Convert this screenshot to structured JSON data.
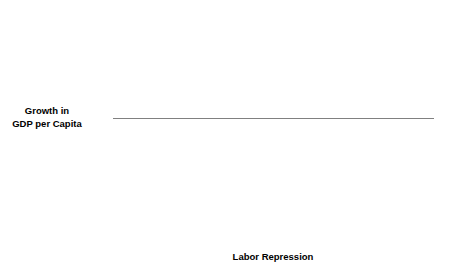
{
  "chart_data": {
    "type": "scatter",
    "title": "",
    "xlabel": "Labor Repression",
    "ylabel_line1": "Growth in",
    "ylabel_line2": "GDP per Capita",
    "xlim": [
      0.0,
      5.0
    ],
    "ylim": [
      -4,
      10
    ],
    "xticks": [
      "0.0",
      "0.5",
      "1.0",
      "1.5",
      "2.0",
      "2.5",
      "3.0",
      "3.5",
      "4.0",
      "4.5",
      "5.0"
    ],
    "xtick_values": [
      0.0,
      0.5,
      1.0,
      1.5,
      2.0,
      2.5,
      3.0,
      3.5,
      4.0,
      4.5,
      5.0
    ],
    "yticks": [
      "10",
      "8",
      "6",
      "4",
      "2",
      "0",
      "−2",
      "−4"
    ],
    "ytick_values": [
      10,
      8,
      6,
      4,
      2,
      0,
      -2,
      -4
    ],
    "grid": false,
    "legend": null,
    "reference_line": {
      "orientation": "horizontal",
      "y": 3.0,
      "color": "#808080"
    },
    "marker_color": "#111111",
    "marker_size": 2.3,
    "points": [
      {
        "x": 0.25,
        "y": -0.62
      },
      {
        "x": 0.29,
        "y": 4.27
      },
      {
        "x": 0.3,
        "y": 3.58
      },
      {
        "x": 0.43,
        "y": 4.35
      },
      {
        "x": 0.44,
        "y": 3.8
      },
      {
        "x": 0.57,
        "y": 2.93
      },
      {
        "x": 0.68,
        "y": 3.18
      },
      {
        "x": 0.7,
        "y": 7.98
      },
      {
        "x": 0.73,
        "y": 0.05
      },
      {
        "x": 0.84,
        "y": 3.12
      },
      {
        "x": 0.85,
        "y": 1.98
      },
      {
        "x": 0.88,
        "y": 2.32
      },
      {
        "x": 0.93,
        "y": 2.03
      },
      {
        "x": 1.0,
        "y": 2.4
      },
      {
        "x": 1.05,
        "y": 1.58
      },
      {
        "x": 1.06,
        "y": 0.2
      },
      {
        "x": 1.18,
        "y": 1.48
      },
      {
        "x": 1.2,
        "y": 0.78
      },
      {
        "x": 1.31,
        "y": 1.15
      },
      {
        "x": 1.35,
        "y": -0.37
      },
      {
        "x": 1.43,
        "y": -2.18
      },
      {
        "x": 1.52,
        "y": 3.92
      },
      {
        "x": 1.62,
        "y": 7.8
      },
      {
        "x": 1.66,
        "y": 4.52
      },
      {
        "x": 1.7,
        "y": 4.52
      },
      {
        "x": 1.85,
        "y": 8.25
      },
      {
        "x": 1.88,
        "y": 2.45
      },
      {
        "x": 2.05,
        "y": 3.62
      },
      {
        "x": 2.07,
        "y": 1.48
      },
      {
        "x": 2.3,
        "y": 6.95
      },
      {
        "x": 2.32,
        "y": 2.48
      },
      {
        "x": 2.42,
        "y": 1.0
      },
      {
        "x": 2.46,
        "y": 4.3
      },
      {
        "x": 2.5,
        "y": 1.0
      },
      {
        "x": 2.55,
        "y": 2.28
      },
      {
        "x": 2.58,
        "y": 6.73
      },
      {
        "x": 2.6,
        "y": 1.42
      },
      {
        "x": 2.66,
        "y": 5.72
      },
      {
        "x": 2.68,
        "y": 1.05
      },
      {
        "x": 2.78,
        "y": 1.8
      },
      {
        "x": 2.82,
        "y": 6.78
      },
      {
        "x": 2.86,
        "y": 8.72
      },
      {
        "x": 2.92,
        "y": 1.08
      },
      {
        "x": 2.98,
        "y": 1.55
      },
      {
        "x": 3.02,
        "y": 6.95
      },
      {
        "x": 3.05,
        "y": 3.83
      },
      {
        "x": 3.08,
        "y": 0.18
      },
      {
        "x": 3.1,
        "y": 1.92
      },
      {
        "x": 3.18,
        "y": 2.25
      },
      {
        "x": 3.22,
        "y": 3.42
      },
      {
        "x": 3.24,
        "y": 0.4
      },
      {
        "x": 3.26,
        "y": 3.72
      },
      {
        "x": 3.28,
        "y": 5.92
      },
      {
        "x": 3.32,
        "y": 1.82
      },
      {
        "x": 3.42,
        "y": 2.42
      },
      {
        "x": 3.45,
        "y": 6.98
      },
      {
        "x": 3.5,
        "y": 5.05
      },
      {
        "x": 3.58,
        "y": 3.4
      },
      {
        "x": 3.6,
        "y": 0.98
      },
      {
        "x": 3.73,
        "y": -1.72
      },
      {
        "x": 3.78,
        "y": 4.18
      },
      {
        "x": 3.82,
        "y": 3.12
      },
      {
        "x": 3.85,
        "y": 2.28
      },
      {
        "x": 3.9,
        "y": 0.58
      },
      {
        "x": 3.98,
        "y": 1.12
      },
      {
        "x": 4.0,
        "y": 2.22
      },
      {
        "x": 4.03,
        "y": 2.2
      },
      {
        "x": 4.02,
        "y": -0.72
      },
      {
        "x": 4.05,
        "y": 0.68
      },
      {
        "x": 4.17,
        "y": -1.55
      },
      {
        "x": 4.18,
        "y": 5.55
      },
      {
        "x": 4.22,
        "y": 6.5
      },
      {
        "x": 4.28,
        "y": 3.75
      },
      {
        "x": 4.35,
        "y": 1.78
      },
      {
        "x": 4.42,
        "y": 1.88
      },
      {
        "x": 4.52,
        "y": 1.58
      },
      {
        "x": 4.67,
        "y": 3.98
      }
    ],
    "annotations": [
      {
        "label": "Singapore",
        "point_x": 2.86,
        "point_y": 8.72,
        "text_x": 2.93,
        "text_y": 8.72,
        "align": "left"
      },
      {
        "label": "Taiwan",
        "point_x": 3.45,
        "point_y": 6.98,
        "text_x": 3.52,
        "text_y": 6.98,
        "align": "left"
      },
      {
        "label": "South Korea",
        "point_x": 3.02,
        "point_y": 6.95,
        "text_x": 3.18,
        "text_y": 6.35,
        "align": "mid"
      },
      {
        "label": "Brazil",
        "point_x": 3.5,
        "point_y": 5.05,
        "text_x": 3.57,
        "text_y": 5.05,
        "align": "left"
      },
      {
        "label": "Mexico",
        "point_x": 1.7,
        "point_y": 4.52,
        "text_x": 1.92,
        "text_y": 4.48,
        "align": "left"
      }
    ]
  }
}
